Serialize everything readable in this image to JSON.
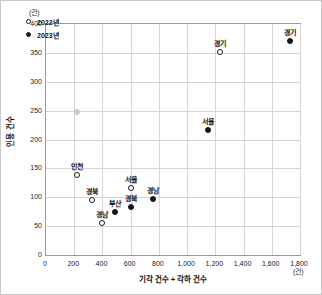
{
  "chart_data": {
    "type": "scatter",
    "title": "",
    "xlabel": "기각 건수 + 각하 건수",
    "ylabel": "인용 건수",
    "x_unit": "(건)",
    "y_unit": "(건)",
    "xlim": [
      0,
      1800
    ],
    "ylim": [
      0,
      400
    ],
    "xticks": [
      "0",
      "200",
      "400",
      "600",
      "800",
      "1,000",
      "1,200",
      "1,400",
      "1,600",
      "1,800"
    ],
    "xtick_values": [
      0,
      200,
      400,
      600,
      800,
      1000,
      1200,
      1400,
      1600,
      1800
    ],
    "yticks": [
      "0",
      "50",
      "100",
      "150",
      "200",
      "250",
      "300",
      "350",
      "400"
    ],
    "ytick_values": [
      0,
      50,
      100,
      150,
      200,
      250,
      300,
      350,
      400
    ],
    "grid": true,
    "legend_position": "top-left",
    "legend": [
      {
        "label": "2022년",
        "marker": "open-circle"
      },
      {
        "label": "2023년",
        "marker": "filled-circle"
      }
    ],
    "series": [
      {
        "name": "2022년",
        "marker": "open-circle",
        "points": [
          {
            "label": "경기",
            "x": 1230,
            "y": 352
          },
          {
            "label": "인천",
            "x": 218,
            "y": 138
          },
          {
            "label": "서울",
            "x": 600,
            "y": 116
          },
          {
            "label": "경북",
            "x": 325,
            "y": 95
          },
          {
            "label": "경남",
            "x": 398,
            "y": 55
          },
          {
            "label": "",
            "x": 222,
            "y": 247
          }
        ]
      },
      {
        "name": "2023년",
        "marker": "filled-circle",
        "points": [
          {
            "label": "경기",
            "x": 1730,
            "y": 371
          },
          {
            "label": "서울",
            "x": 1148,
            "y": 217
          },
          {
            "label": "경남",
            "x": 758,
            "y": 97
          },
          {
            "label": "경북",
            "x": 605,
            "y": 83
          },
          {
            "label": "부산",
            "x": 490,
            "y": 74
          }
        ]
      }
    ]
  }
}
